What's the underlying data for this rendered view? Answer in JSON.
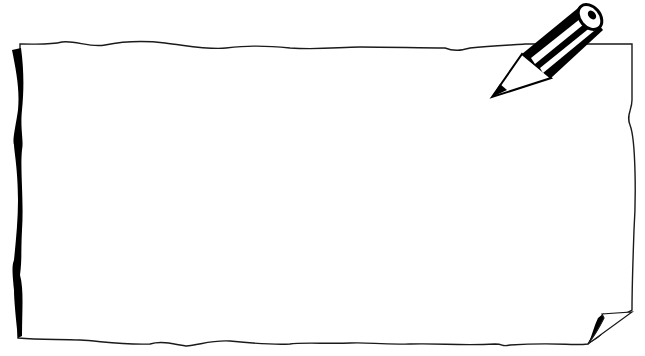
{
  "illustration": {
    "subject": "blank paper sheet with pencil",
    "faint_text": "",
    "colors": {
      "background": "#ffffff",
      "paper": "#ffffff",
      "outline": "#1a1a1a",
      "ink": "#000000"
    },
    "icons": {
      "pencil": "pencil-icon",
      "curled_corner": "page-curl-icon"
    }
  }
}
